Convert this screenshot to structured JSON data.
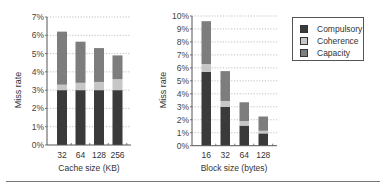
{
  "colors": {
    "compulsory": "#3a3a3a",
    "coherence": "#c6c6c6",
    "capacity": "#7d7d7d",
    "axis": "#555555",
    "grid": "#b0b0b0"
  },
  "legend": {
    "items": [
      {
        "label": "Compulsory",
        "color": "#3a3a3a"
      },
      {
        "label": "Coherence",
        "color": "#c6c6c6"
      },
      {
        "label": "Capacity",
        "color": "#7d7d7d"
      }
    ]
  },
  "chart_data": [
    {
      "type": "bar",
      "stacked": true,
      "title": "",
      "xlabel": "Cache size (KB)",
      "ylabel": "Miss rate",
      "categories": [
        "32",
        "64",
        "128",
        "256"
      ],
      "ylim": [
        0,
        7
      ],
      "yticks": [
        "0%",
        "1%",
        "2%",
        "3%",
        "4%",
        "5%",
        "6%",
        "7%"
      ],
      "grid": "horizontal dotted",
      "series": [
        {
          "name": "Compulsory",
          "values": [
            3.0,
            3.0,
            3.0,
            3.0
          ]
        },
        {
          "name": "Coherence",
          "values": [
            0.3,
            0.4,
            0.45,
            0.6
          ]
        },
        {
          "name": "Capacity",
          "values": [
            2.9,
            2.25,
            1.85,
            1.3
          ]
        }
      ],
      "totals": [
        6.2,
        5.65,
        5.3,
        4.9
      ]
    },
    {
      "type": "bar",
      "stacked": true,
      "title": "",
      "xlabel": "Block size (bytes)",
      "ylabel": "Miss rate",
      "categories": [
        "16",
        "32",
        "64",
        "128"
      ],
      "ylim": [
        0,
        10
      ],
      "yticks": [
        "0%",
        "1%",
        "2%",
        "3%",
        "4%",
        "5%",
        "6%",
        "7%",
        "8%",
        "9%",
        "10%"
      ],
      "grid": "horizontal dotted",
      "series": [
        {
          "name": "Compulsory",
          "values": [
            5.7,
            3.0,
            1.55,
            0.95
          ]
        },
        {
          "name": "Coherence",
          "values": [
            0.6,
            0.45,
            0.35,
            0.2
          ]
        },
        {
          "name": "Capacity",
          "values": [
            3.3,
            2.3,
            1.45,
            1.1
          ]
        }
      ],
      "totals": [
        9.6,
        5.75,
        3.35,
        2.25
      ]
    }
  ],
  "legend_position": "upper right"
}
